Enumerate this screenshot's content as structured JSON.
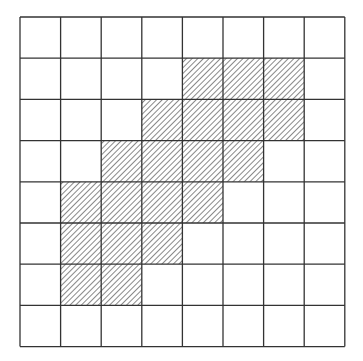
{
  "diagram": {
    "type": "grid",
    "rows": 8,
    "cols": 8,
    "origin": [
      19,
      16
    ],
    "cell_width": 40.6,
    "cell_height": 41.2,
    "line_color": "#333333",
    "hatch_color": "#555555",
    "shaded_cells": [
      [
        1,
        4
      ],
      [
        1,
        5
      ],
      [
        1,
        6
      ],
      [
        2,
        3
      ],
      [
        2,
        4
      ],
      [
        2,
        5
      ],
      [
        2,
        6
      ],
      [
        3,
        2
      ],
      [
        3,
        3
      ],
      [
        3,
        4
      ],
      [
        3,
        5
      ],
      [
        4,
        1
      ],
      [
        4,
        2
      ],
      [
        4,
        3
      ],
      [
        4,
        4
      ],
      [
        5,
        1
      ],
      [
        5,
        2
      ],
      [
        5,
        3
      ],
      [
        6,
        1
      ],
      [
        6,
        2
      ]
    ]
  }
}
